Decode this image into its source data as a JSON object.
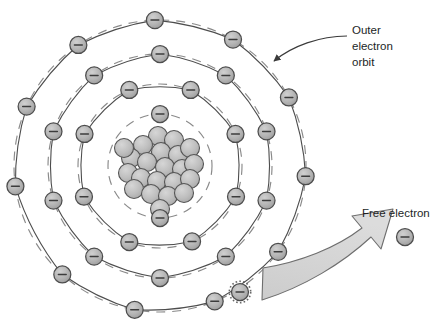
{
  "figure": {
    "background": "#ffffff",
    "width": 438,
    "height": 330
  },
  "colors": {
    "particle_fill": "#b0b0b0",
    "particle_stroke": "#4d4d4d",
    "nucleus_fill": "#bcbcbc",
    "nucleus_stroke": "#555555",
    "orbit_stroke": "#8a8a8a",
    "arrow_fill": "#d2d2d2",
    "arrow_stroke": "#6e6e6e",
    "text": "#221f1f",
    "leader_stroke": "#3a3a3a"
  },
  "labels": {
    "outer_orbit": {
      "lines": [
        "Outer",
        "electron",
        "orbit"
      ],
      "line1": "Outer",
      "line2": "electron",
      "line3": "orbit",
      "x": 352,
      "y": 30
    },
    "free_electron": {
      "text": "Free electron",
      "x": 362,
      "y": 214
    }
  },
  "atom": {
    "center": {
      "x": 160,
      "y": 166
    },
    "nucleus": {
      "name": "nucleus",
      "particle_count": 22,
      "particle_radius": 9.5,
      "particles": [
        {
          "x": -2,
          "y": -30
        },
        {
          "x": 14,
          "y": -26
        },
        {
          "x": -17,
          "y": -21
        },
        {
          "x": 1,
          "y": -14
        },
        {
          "x": 18,
          "y": -11
        },
        {
          "x": 30,
          "y": -18
        },
        {
          "x": -29,
          "y": -8
        },
        {
          "x": -13,
          "y": -4
        },
        {
          "x": 5,
          "y": 1
        },
        {
          "x": 22,
          "y": 3
        },
        {
          "x": 34,
          "y": -2
        },
        {
          "x": -32,
          "y": 7
        },
        {
          "x": -19,
          "y": 12
        },
        {
          "x": -3,
          "y": 15
        },
        {
          "x": 14,
          "y": 16
        },
        {
          "x": 30,
          "y": 13
        },
        {
          "x": -26,
          "y": 23
        },
        {
          "x": -9,
          "y": 28
        },
        {
          "x": 8,
          "y": 30
        },
        {
          "x": 24,
          "y": 27
        },
        {
          "x": -36,
          "y": -18
        },
        {
          "x": 0,
          "y": 43
        }
      ]
    },
    "orbits": [
      {
        "name": "orbit-1-inner",
        "radius": 52,
        "electron_count": 2,
        "electrons": [
          {
            "angle": 180
          },
          {
            "angle": 0
          }
        ]
      },
      {
        "name": "orbit-2",
        "radius": 82,
        "electron_count": 8,
        "electrons": [
          {
            "angle": 248
          },
          {
            "angle": 293
          },
          {
            "angle": 338
          },
          {
            "angle": 22
          },
          {
            "angle": 67
          },
          {
            "angle": 112
          },
          {
            "angle": 157
          },
          {
            "angle": 202
          }
        ]
      },
      {
        "name": "orbit-3",
        "radius": 112,
        "electron_count": 10,
        "electrons": [
          {
            "angle": 252
          },
          {
            "angle": 288
          },
          {
            "angle": 324
          },
          {
            "angle": 360
          },
          {
            "angle": 36
          },
          {
            "angle": 72
          },
          {
            "angle": 108
          },
          {
            "angle": 144
          },
          {
            "angle": 180
          },
          {
            "angle": 216
          }
        ]
      },
      {
        "name": "orbit-4-outer",
        "radius": 146,
        "electron_count": 11,
        "electrons": [
          {
            "angle": 262
          },
          {
            "angle": 294
          },
          {
            "angle": 326
          },
          {
            "angle": 358
          },
          {
            "angle": 30
          },
          {
            "angle": 62
          },
          {
            "angle": 94
          },
          {
            "angle": 126
          },
          {
            "angle": 158
          },
          {
            "angle": 190
          },
          {
            "angle": 222
          }
        ]
      }
    ],
    "electron_radius": 8.5,
    "electron_symbol": "minus",
    "escaping_electron": {
      "x": 240,
      "y": 292,
      "highlighted": true
    }
  },
  "free_electron": {
    "name": "free-electron",
    "x": 405,
    "y": 237,
    "radius": 8.5,
    "symbol": "minus"
  },
  "arrow": {
    "name": "emission-arrow",
    "description": "curved block arrow sweeping from lower-left to upper-right",
    "from": {
      "x": 262,
      "y": 300
    },
    "to": {
      "x": 380,
      "y": 226
    }
  },
  "leader": {
    "name": "outer-orbit-leader",
    "from": {
      "x": 345,
      "y": 36
    },
    "to": {
      "x": 272,
      "y": 63
    }
  }
}
